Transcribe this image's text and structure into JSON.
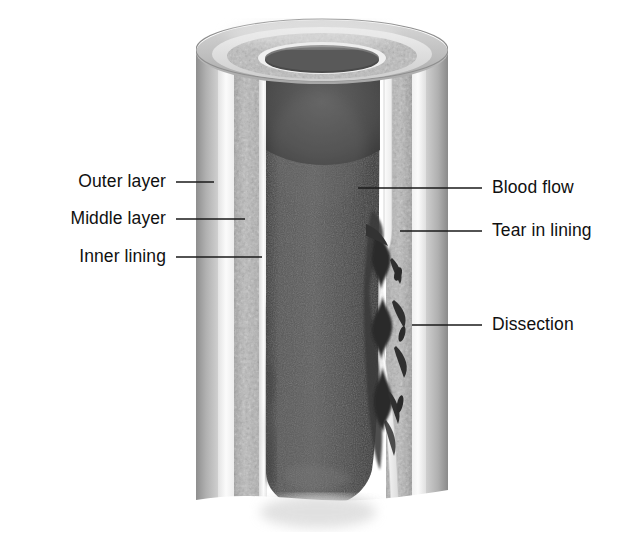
{
  "figure": {
    "type": "medical-illustration",
    "style": "grayscale-airbrush",
    "width": 622,
    "height": 545
  },
  "labels": {
    "left": [
      {
        "id": "outer-layer",
        "text": "Outer layer",
        "text_x": 166,
        "text_y": 182,
        "line_x1": 176,
        "line_x2": 214,
        "line_y": 182
      },
      {
        "id": "middle-layer",
        "text": "Middle layer",
        "text_x": 166,
        "text_y": 219,
        "line_x1": 176,
        "line_x2": 245,
        "line_y": 219
      },
      {
        "id": "inner-lining",
        "text": "Inner lining",
        "text_x": 166,
        "text_y": 257,
        "line_x1": 176,
        "line_x2": 262,
        "line_y": 257
      }
    ],
    "right": [
      {
        "id": "blood-flow",
        "text": "Blood flow",
        "text_x": 492,
        "text_y": 188,
        "line_x1": 358,
        "line_x2": 482,
        "line_y": 188
      },
      {
        "id": "tear-in-lining",
        "text": "Tear in lining",
        "text_x": 492,
        "text_y": 231,
        "line_x1": 400,
        "line_x2": 482,
        "line_y": 231
      },
      {
        "id": "dissection",
        "text": "Dissection",
        "text_x": 492,
        "text_y": 325,
        "line_x1": 412,
        "line_x2": 482,
        "line_y": 325
      }
    ]
  },
  "anatomy": {
    "vessel": {
      "outer_left_x": 196,
      "outer_right_x": 448,
      "top_y": 20,
      "bottom_y": 545,
      "rim_ellipse_cy": 52,
      "rim_ellipse_ry": 32
    },
    "lumen": {
      "left_x": 265,
      "right_x": 385,
      "bottom_y": 497
    },
    "tear_y": 237,
    "dissection_top_y": 232,
    "dissection_bottom_y": 432
  },
  "colors": {
    "background": "#ffffff",
    "label_text": "#101010",
    "leader_line": "#1a1a1a",
    "outer_layer": "#a9a9a9",
    "outer_layer_dark": "#8e8e8e",
    "light_band": "#f2f2f2",
    "middle_layer": "#b4b4b4",
    "middle_layer_dark": "#9a9a9a",
    "middle_stipple": "#c9c9c9",
    "inner_lining": "#f6f6f6",
    "inner_lining_edge": "#cfcfcf",
    "blood": "#4a4a4a",
    "blood_dark": "#333333",
    "blood_highlight": "#6a6a6a",
    "dissection": "#2a2a2a",
    "shadow": "#d7d7d7"
  }
}
